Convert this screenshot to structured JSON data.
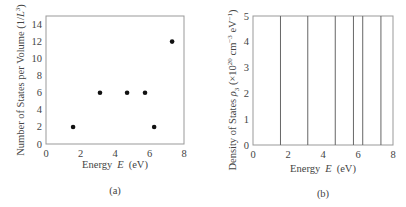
{
  "chart_data": [
    {
      "type": "scatter",
      "panel": "(a)",
      "title": "",
      "xlabel": "Energy E (eV)",
      "ylabel": "Number of States per Volume (1/L³)",
      "xlim": [
        0,
        8
      ],
      "ylim": [
        0,
        15
      ],
      "xticks": [
        0,
        2,
        4,
        6,
        8
      ],
      "yticks": [
        0,
        2,
        4,
        6,
        8,
        10,
        12,
        14
      ],
      "grid": false,
      "x": [
        1.57,
        3.13,
        4.7,
        5.74,
        6.27,
        7.31
      ],
      "y": [
        2,
        6,
        6,
        6,
        2,
        12
      ],
      "caption": "(a)"
    },
    {
      "type": "line",
      "panel": "(b)",
      "title": "",
      "xlabel": "Energy E (eV)",
      "ylabel": "Density of States ρ₃ (×10²⁰ cm⁻³ eV⁻¹)",
      "xlim": [
        0,
        8
      ],
      "ylim": [
        0,
        5
      ],
      "xticks": [
        0,
        2,
        4,
        6,
        8
      ],
      "yticks": [
        0,
        1,
        2,
        3,
        4,
        5
      ],
      "grid": false,
      "vertical_lines_x": [
        1.57,
        3.13,
        4.7,
        5.74,
        6.27,
        7.31
      ],
      "note": "delta-function spikes extending beyond y=5",
      "caption": "(b)"
    }
  ],
  "panel_a": {
    "xlabel_prefix": "Energy",
    "xlabel_var": "E",
    "xlabel_unit": "(eV)",
    "ylabel_main": "Number of States per Volume (1/",
    "ylabel_var": "L",
    "ylabel_sup": "3",
    "ylabel_end": ")",
    "caption": "(a)",
    "xtick_labels": [
      "0",
      "2",
      "4",
      "6",
      "8"
    ],
    "ytick_labels": [
      "0",
      "2",
      "4",
      "6",
      "8",
      "10",
      "12",
      "14"
    ]
  },
  "panel_b": {
    "xlabel_prefix": "Energy",
    "xlabel_var": "E",
    "xlabel_unit": "(eV)",
    "ylabel_main": "Density of States ",
    "ylabel_var": "ρ",
    "ylabel_sub": "3",
    "ylabel_unit_a": "  (×10",
    "ylabel_sup1": "20",
    "ylabel_unit_b": " cm",
    "ylabel_sup2": "−3",
    "ylabel_unit_c": " eV",
    "ylabel_sup3": "−1",
    "ylabel_end": ")",
    "caption": "(b)",
    "xtick_labels": [
      "0",
      "2",
      "4",
      "6",
      "8"
    ],
    "ytick_labels": [
      "0",
      "1",
      "2",
      "3",
      "4",
      "5"
    ]
  },
  "colors": {
    "frame": "#999999",
    "marker": "#111111",
    "line": "#666666",
    "text": "#444444"
  }
}
